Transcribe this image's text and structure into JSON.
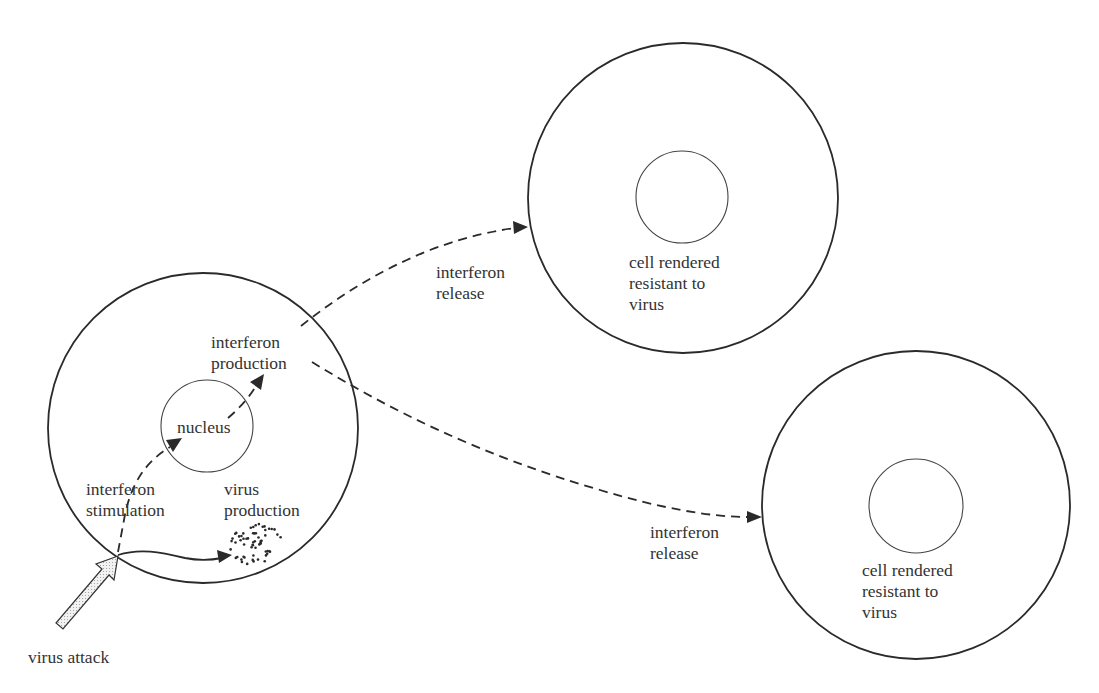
{
  "labels": {
    "infected_cell": {
      "nucleus": "nucleus",
      "interferon_production": [
        "interferon",
        "production"
      ],
      "interferon_stimulation": [
        "interferon",
        "stimulation"
      ],
      "virus_production": [
        "virus",
        "production"
      ]
    },
    "virus_attack": "virus attack",
    "release_top": [
      "interferon",
      "release"
    ],
    "release_bottom": [
      "interferon",
      "release"
    ],
    "resistant_cell_top": [
      "cell rendered",
      "resistant to",
      "virus"
    ],
    "resistant_cell_bottom": [
      "cell rendered",
      "resistant to",
      "virus"
    ]
  },
  "colors": {
    "line": "#2a2a2a",
    "text": "#333333",
    "arrow_fill": "#e6e6e6",
    "background": "#ffffff"
  }
}
